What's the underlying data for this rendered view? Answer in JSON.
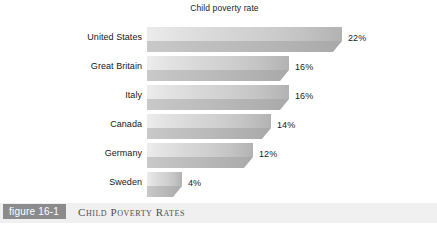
{
  "chart_data": {
    "type": "bar",
    "orientation": "horizontal",
    "title": "Child poverty rate",
    "xlabel": "",
    "ylabel": "",
    "grid": false,
    "legend": "none",
    "xlim": [
      0,
      22
    ],
    "categories": [
      "United States",
      "Great Britain",
      "Italy",
      "Canada",
      "Germany",
      "Sweden"
    ],
    "values": [
      22,
      16,
      16,
      14,
      12,
      4
    ],
    "value_labels": [
      "22%",
      "16%",
      "16%",
      "14%",
      "12%",
      "4%"
    ],
    "bars": [
      {
        "category": "United States",
        "value": 22,
        "label": "22%"
      },
      {
        "category": "Great Britain",
        "value": 16,
        "label": "16%"
      },
      {
        "category": "Italy",
        "value": 16,
        "label": "16%"
      },
      {
        "category": "Canada",
        "value": 14,
        "label": "14%"
      },
      {
        "category": "Germany",
        "value": 12,
        "label": "12%"
      },
      {
        "category": "Sweden",
        "value": 4,
        "label": "4%"
      }
    ]
  },
  "caption": {
    "badge": "figure 16-1",
    "text": "Child Poverty Rates"
  },
  "colors": {
    "page_background": "#ffffff",
    "bar_top_light": "#ececed",
    "bar_top_dark": "#b2b2b3",
    "bar_bottom": "#bbbbbc",
    "caption_strip": "#f0f0f1",
    "badge_background": "#8b8b8e",
    "badge_text": "#ffffff",
    "caption_text": "#4e4e52",
    "label_text": "#171717"
  }
}
